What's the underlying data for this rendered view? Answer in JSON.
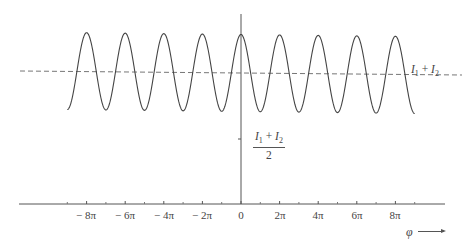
{
  "chart_data": {
    "type": "line",
    "title": "",
    "xlabel": "φ",
    "ylabel": "",
    "grid": false,
    "legend": null,
    "x_ticks": [
      {
        "value": -8,
        "label": "− 8π"
      },
      {
        "value": -6,
        "label": "− 6π"
      },
      {
        "value": -4,
        "label": "− 4π"
      },
      {
        "value": -2,
        "label": "− 2π"
      },
      {
        "value": 0,
        "label": "0"
      },
      {
        "value": 2,
        "label": "2π"
      },
      {
        "value": 4,
        "label": "4π"
      },
      {
        "value": 6,
        "label": "6π"
      },
      {
        "value": 8,
        "label": "8π"
      }
    ],
    "x_unit": "π",
    "xlim_in_pi": [
      -11.6,
      10.6
    ],
    "minor_ticks_in_pi": [
      -9,
      -7,
      -5,
      -3,
      -1,
      1,
      3,
      5,
      7,
      9
    ],
    "y_ticks": [
      {
        "name": "half_sum",
        "label": "(I1 + I2)/2",
        "value_relative": 0.5
      }
    ],
    "series": [
      {
        "name": "interference intensity",
        "style": "solid",
        "function": "I = (I1 + I2) + A·cos(φ)",
        "phi_range_in_pi": [
          -9,
          9
        ],
        "peaks_at_in_pi": [
          -8,
          -6,
          -4,
          -2,
          0,
          2,
          4,
          6,
          8
        ],
        "troughs_at_in_pi": [
          -9,
          -7,
          -5,
          -3,
          -1,
          1,
          3,
          5,
          7,
          9
        ],
        "mean_relative": 1.0,
        "amplitude_relative": 0.58
      },
      {
        "name": "I1 + I2",
        "style": "dashed",
        "value_relative": 1.0,
        "label": "I1 + I2"
      }
    ],
    "annotations": [
      "I1 + I2",
      "(I1 + I2)/2",
      "φ →"
    ]
  },
  "labels": {
    "series_label": {
      "a": "I",
      "a_sub": "1",
      "plus": " + ",
      "b": "I",
      "b_sub": "2"
    },
    "ytick": {
      "a": "I",
      "a_sub": "1",
      "plus": " + ",
      "b": "I",
      "b_sub": "2",
      "den": "2"
    },
    "xlabel": "φ",
    "ticks": [
      "− 8π",
      "− 6π",
      "− 4π",
      "− 2π",
      "0",
      "2π",
      "4π",
      "6π",
      "8π"
    ]
  }
}
